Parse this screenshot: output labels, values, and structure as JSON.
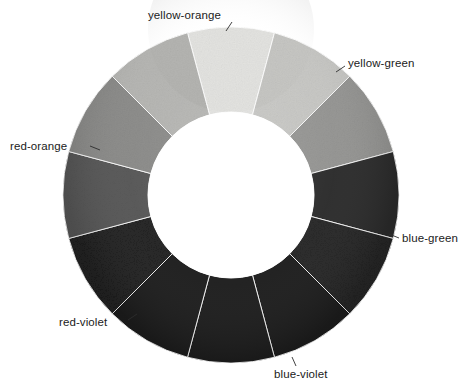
{
  "figure": {
    "type": "color-wheel-diagram",
    "title": "",
    "background_color": "#ffffff",
    "center": {
      "x": 231,
      "y": 195
    },
    "outer_radius": 168,
    "inner_radius": 83,
    "inner_hole_color": "#ffffff",
    "segment_count": 12,
    "segment_arc_degrees": 30,
    "label_text_color": "#1b1b1b",
    "label_font_size_px": 11.5
  },
  "chart_data": {
    "type": "pie",
    "xlabel": "",
    "ylabel": "",
    "legend_position": "around-ring",
    "grid": false,
    "categories": [
      "yellow",
      "yellow-green",
      "green",
      "blue-green",
      "blue",
      "blue-violet",
      "violet",
      "red-violet",
      "red",
      "red-orange",
      "orange",
      "yellow-orange"
    ],
    "values": [
      30,
      30,
      30,
      30,
      30,
      30,
      30,
      30,
      30,
      30,
      30,
      30
    ],
    "colors": [
      "#e3e3e0",
      "#c6c6c3",
      "#949492",
      "#2c2c2c",
      "#252525",
      "#1f1f1f",
      "#1c1c1c",
      "#1d1d1d",
      "#202020",
      "#565656",
      "#8a8a88",
      "#b4b4b1"
    ],
    "labeled_slices": [
      "yellow-orange",
      "yellow-green",
      "red-orange",
      "blue-green",
      "red-violet",
      "blue-violet"
    ]
  },
  "segments": [
    {
      "name": "yellow",
      "start_deg": -15,
      "end_deg": 15,
      "fill": "#e3e3e0",
      "labeled": false
    },
    {
      "name": "yellow-green",
      "start_deg": 15,
      "end_deg": 45,
      "fill": "#c6c6c3",
      "labeled": true
    },
    {
      "name": "green",
      "start_deg": 45,
      "end_deg": 75,
      "fill": "#949492",
      "labeled": false
    },
    {
      "name": "blue-green",
      "start_deg": 75,
      "end_deg": 105,
      "fill": "#2c2c2c",
      "labeled": true
    },
    {
      "name": "blue",
      "start_deg": 105,
      "end_deg": 135,
      "fill": "#252525",
      "labeled": false
    },
    {
      "name": "blue-violet",
      "start_deg": 135,
      "end_deg": 165,
      "fill": "#1f1f1f",
      "labeled": true
    },
    {
      "name": "violet",
      "start_deg": 165,
      "end_deg": 195,
      "fill": "#1c1c1c",
      "labeled": false
    },
    {
      "name": "red-violet",
      "start_deg": 195,
      "end_deg": 225,
      "fill": "#1d1d1d",
      "labeled": true
    },
    {
      "name": "red",
      "start_deg": 225,
      "end_deg": 255,
      "fill": "#202020",
      "labeled": false
    },
    {
      "name": "red-orange",
      "start_deg": 255,
      "end_deg": 285,
      "fill": "#565656",
      "labeled": true
    },
    {
      "name": "orange",
      "start_deg": 285,
      "end_deg": 315,
      "fill": "#8a8a88",
      "labeled": false
    },
    {
      "name": "yellow-orange",
      "start_deg": 315,
      "end_deg": 345,
      "fill": "#b4b4b1",
      "labeled": true
    }
  ],
  "labels": [
    {
      "id": "yellow-orange",
      "text": "yellow-orange",
      "x": 148,
      "y": 10,
      "align": "left"
    },
    {
      "id": "yellow-green",
      "text": "yellow-green",
      "x": 348,
      "y": 58,
      "align": "left"
    },
    {
      "id": "red-orange",
      "text": "red-orange",
      "x": 10,
      "y": 141,
      "align": "left"
    },
    {
      "id": "blue-green",
      "text": "blue-green",
      "x": 402,
      "y": 233,
      "align": "left"
    },
    {
      "id": "red-violet",
      "text": "red-violet",
      "x": 59,
      "y": 317,
      "align": "left"
    },
    {
      "id": "blue-violet",
      "text": "blue-violet",
      "x": 274,
      "y": 369,
      "align": "left"
    }
  ],
  "leader_lines": [
    {
      "id": "yellow-orange-leader",
      "x1": 232,
      "y1": 22,
      "x2": 226,
      "y2": 31
    },
    {
      "id": "yellow-green-leader",
      "x1": 345,
      "y1": 66,
      "x2": 336,
      "y2": 72
    },
    {
      "id": "red-orange-leader",
      "x1": 90,
      "y1": 146,
      "x2": 100,
      "y2": 150
    },
    {
      "id": "blue-green-leader",
      "x1": 399,
      "y1": 238,
      "x2": 389,
      "y2": 234
    },
    {
      "id": "red-violet-leader",
      "x1": 128,
      "y1": 320,
      "x2": 137,
      "y2": 314
    },
    {
      "id": "blue-violet-leader",
      "x1": 296,
      "y1": 366,
      "x2": 292,
      "y2": 357
    }
  ]
}
